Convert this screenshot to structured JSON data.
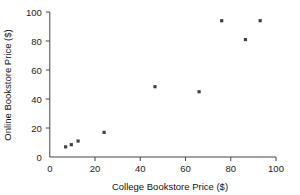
{
  "chart_data": {
    "type": "scatter",
    "title": "",
    "xlabel": "College Bookstore Price ($)",
    "ylabel": "Online Bookstore Price ($)",
    "xlim": [
      0,
      100
    ],
    "ylim": [
      0,
      100
    ],
    "xticks": [
      0,
      20,
      40,
      60,
      80,
      100
    ],
    "yticks": [
      0,
      20,
      40,
      60,
      80,
      100
    ],
    "xtick_labels": [
      "0",
      "20",
      "40",
      "60",
      "80",
      "100"
    ],
    "ytick_labels": [
      "0",
      "20",
      "40",
      "60",
      "80",
      "100"
    ],
    "grid": false,
    "legend": null,
    "marker_color": "#3f3f46",
    "marker_shape": "square",
    "series": [
      {
        "name": "Textbook prices",
        "points": [
          {
            "x": 7.0,
            "y": 7.0
          },
          {
            "x": 9.5,
            "y": 8.5
          },
          {
            "x": 12.5,
            "y": 11.0
          },
          {
            "x": 24.0,
            "y": 17.0
          },
          {
            "x": 46.5,
            "y": 48.5
          },
          {
            "x": 66.0,
            "y": 45.0
          },
          {
            "x": 76.0,
            "y": 94.0
          },
          {
            "x": 86.5,
            "y": 81.0
          },
          {
            "x": 93.0,
            "y": 94.0
          }
        ]
      }
    ]
  }
}
